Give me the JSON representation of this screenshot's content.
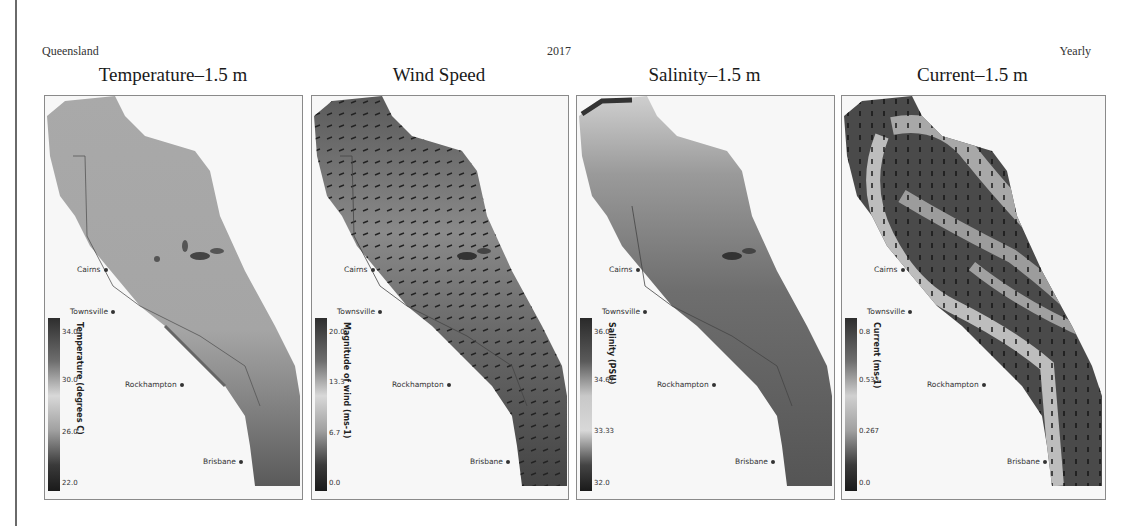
{
  "header": {
    "region": "Queensland",
    "year": "2017",
    "period": "Yearly"
  },
  "panels": [
    {
      "title": "Temperature–1.5 m",
      "colorbar": {
        "label": "Temperature (degrees C)",
        "ticks": [
          "34.0",
          "30.0",
          "26.0",
          "22.0"
        ]
      },
      "has_vectors": false
    },
    {
      "title": "Wind Speed",
      "colorbar": {
        "label": "Magnitude of wind (ms-1)",
        "ticks": [
          "20.0",
          "13.3",
          "6.7",
          "0.0"
        ]
      },
      "has_vectors": true
    },
    {
      "title": "Salinity–1.5 m",
      "colorbar": {
        "label": "Salinity (PSU)",
        "ticks": [
          "36.0",
          "34.67",
          "33.33",
          "32.0"
        ]
      },
      "has_vectors": false
    },
    {
      "title": "Current–1.5 m",
      "colorbar": {
        "label": "Current (ms-1)",
        "ticks": [
          "0.8",
          "0.533",
          "0.267",
          "0.0"
        ]
      },
      "has_vectors": true
    }
  ],
  "cities": [
    "Cairns",
    "Townsville",
    "Rockhampton",
    "Brisbane"
  ]
}
